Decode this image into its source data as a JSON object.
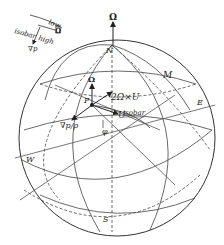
{
  "diagram": {
    "inset": {
      "low_label": "low",
      "high_label": "high",
      "isobar_label": "isobar",
      "gradient_label": "∇p",
      "omega_mark": "Ω"
    },
    "sphere": {
      "north_label": "N",
      "south_label": "S",
      "east_label": "E",
      "west_label": "W",
      "meridian_label": "M",
      "axis_label": "Ω"
    },
    "point": {
      "point_label": "P",
      "local_omega_label": "Ω",
      "coriolis_label": "2Ω×U",
      "velocity_label": "U",
      "isobar_label": "isobar",
      "pressure_gradient_label": "∇p/ρ",
      "latitude_angle_label": "φ"
    },
    "colors": {
      "stroke": "#333333",
      "background": "#ffffff"
    }
  }
}
